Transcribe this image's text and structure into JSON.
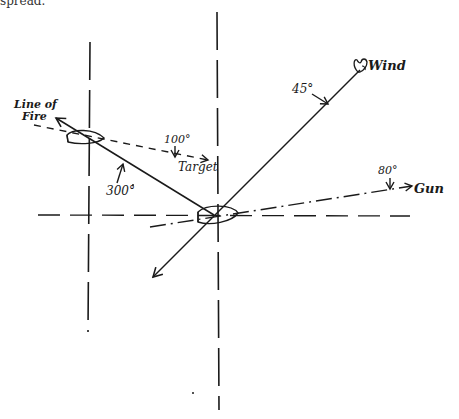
{
  "diagram": {
    "top_text": "spread.",
    "labels": {
      "wind": "Wind",
      "wind_angle": "45°",
      "line_of_fire_1": "Line of",
      "line_of_fire_2": "Fire",
      "target_angle": "100°",
      "target": "Target",
      "fire_angle": "300°",
      "gun_angle": "80°",
      "gun": "Gun"
    },
    "colors": {
      "ink": "#1a1a1a",
      "background": "#ffffff"
    },
    "elements": [
      {
        "type": "vertical-dashed-line",
        "x": 90
      },
      {
        "type": "vertical-dashed-line",
        "x": 217
      },
      {
        "type": "horizontal-dashed-line",
        "y": 215
      },
      {
        "type": "ship",
        "position": "center"
      },
      {
        "type": "ship",
        "position": "left"
      },
      {
        "type": "wind-vector",
        "bearing": "45°"
      },
      {
        "type": "line-of-fire",
        "bearing": "300°"
      },
      {
        "type": "target-bearing",
        "bearing": "100°"
      },
      {
        "type": "gun-bearing",
        "bearing": "80°"
      }
    ]
  }
}
